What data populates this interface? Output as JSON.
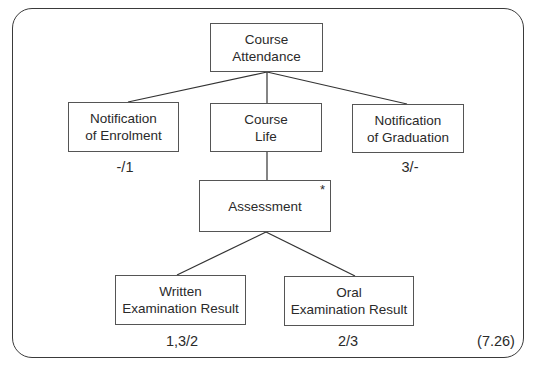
{
  "diagram": {
    "type": "hierarchy-tree",
    "nodes": [
      {
        "id": "course_attendance",
        "text": "Course\nAttendance",
        "parent": null
      },
      {
        "id": "notification_enrolment",
        "text": "Notification\nof Enrolment",
        "parent": "course_attendance",
        "cardinality": "-/1"
      },
      {
        "id": "course_life",
        "text": "Course\nLife",
        "parent": "course_attendance"
      },
      {
        "id": "notification_graduation",
        "text": "Notification\nof Graduation",
        "parent": "course_attendance",
        "cardinality": "3/-"
      },
      {
        "id": "assessment",
        "text": "Assessment",
        "parent": "course_life",
        "marker": "*"
      },
      {
        "id": "written_exam",
        "text": "Written\nExamination Result",
        "parent": "assessment",
        "cardinality": "1,3/2"
      },
      {
        "id": "oral_exam",
        "text": "Oral\nExamination Result",
        "parent": "assessment",
        "cardinality": "2/3"
      }
    ],
    "figure_number": "(7.26)"
  }
}
